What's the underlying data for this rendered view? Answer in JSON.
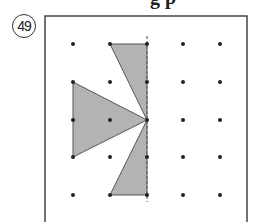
{
  "problem": {
    "number_label": "49",
    "top_partial_text": "g p"
  },
  "grid": {
    "cols": 5,
    "rows": 5,
    "x": [
      73,
      110,
      147,
      183,
      220
    ],
    "y": [
      44,
      82,
      120,
      157,
      195
    ]
  },
  "colors": {
    "fill": "#b3b3b3",
    "stroke": "#555555",
    "dot": "#222222",
    "border": "#444444"
  },
  "shapes": [
    {
      "name": "top-triangle",
      "points": "110,44 147,44 147,120"
    },
    {
      "name": "left-triangle",
      "points": "73,82 73,157 147,120"
    },
    {
      "name": "bottom-triangle",
      "points": "147,120 147,195 110,195"
    }
  ],
  "axis": {
    "x": 147,
    "y1": 36,
    "y2": 202
  }
}
